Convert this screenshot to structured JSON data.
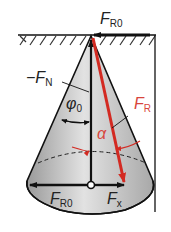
{
  "diagram": {
    "type": "cone friction diagram",
    "labels": {
      "fr0_top": {
        "main": "F",
        "sub": "R0"
      },
      "minus_fn": {
        "main": "−F",
        "sub": "N"
      },
      "phi0": {
        "main": "φ",
        "sub": "0"
      },
      "fr": {
        "main": "F",
        "sub": "R"
      },
      "alpha": {
        "main": "α"
      },
      "fr0_bottom": {
        "main": "F",
        "sub": "R0"
      },
      "fx": {
        "main": "F",
        "sub": "x"
      }
    },
    "colors": {
      "line": "#111111",
      "red_force": "#d32a22",
      "cone_fill": "#c8c8c8",
      "label_red": "#d8453c"
    }
  }
}
